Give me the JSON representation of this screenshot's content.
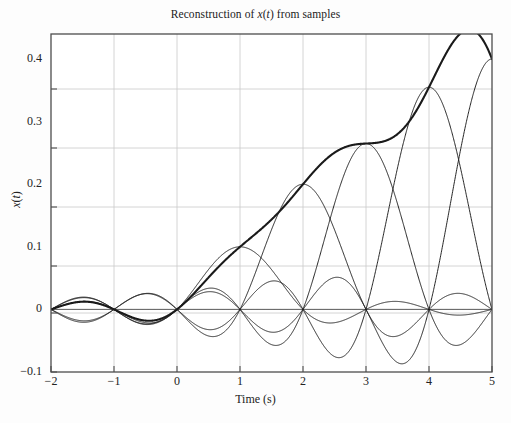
{
  "chart_data": {
    "type": "line",
    "title": "Reconstruction of x(t) from samples",
    "xlabel": "Time (s)",
    "ylabel": "x(t)",
    "xlim": [
      -2,
      5
    ],
    "ylim": [
      -0.1,
      0.44
    ],
    "grid": true,
    "legend": "none",
    "xticks": [
      -2,
      -1,
      0,
      1,
      2,
      3,
      4,
      5
    ],
    "xtick_labels": [
      "−2",
      "−1",
      "0",
      "1",
      "2",
      "3",
      "4",
      "5"
    ],
    "yticks": [
      -0.1,
      0,
      0.1,
      0.2,
      0.3,
      0.4
    ],
    "ytick_labels": [
      "−0.1",
      "0",
      "0.1",
      "0.2",
      "0.3",
      "0.4"
    ],
    "sample_period": 1.0,
    "sample_times": [
      0,
      1,
      2,
      3,
      4,
      5
    ],
    "sample_values": [
      0,
      0.1,
      0.2,
      0.265,
      0.355,
      0.4
    ],
    "series": [
      {
        "name": "sinc component at t=0",
        "weight": 0.0,
        "center": 0,
        "style": "thin"
      },
      {
        "name": "sinc component at t=1",
        "weight": 0.1,
        "center": 1,
        "style": "thin"
      },
      {
        "name": "sinc component at t=2",
        "weight": 0.2,
        "center": 2,
        "style": "thin"
      },
      {
        "name": "sinc component at t=3",
        "weight": 0.265,
        "center": 3,
        "style": "thin"
      },
      {
        "name": "sinc component at t=4",
        "weight": 0.355,
        "center": 4,
        "style": "thin"
      },
      {
        "name": "sinc component at t=5",
        "weight": 0.4,
        "center": 5,
        "style": "thin"
      },
      {
        "name": "reconstructed x(t)",
        "style": "bold"
      }
    ],
    "annotations": []
  },
  "style": {
    "axis_color": "#4d4d4d",
    "grid_color": "#c9c9c9",
    "curve_color": "#1a1a1a",
    "background": "#fdfdfd"
  }
}
